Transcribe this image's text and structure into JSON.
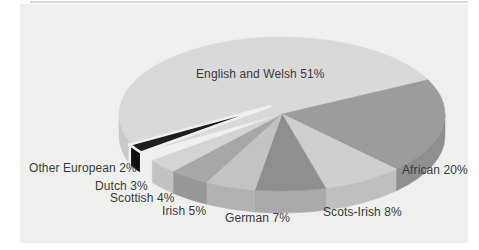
{
  "figure": {
    "background": "#ffffff",
    "panel_color": "#eff0ee",
    "top_edge_color": "#cfcfcf",
    "text_color": "#3a3a3a"
  },
  "chart_data": {
    "type": "pie",
    "style": "3d",
    "title": "",
    "unit": "percent",
    "grid": false,
    "legend_position": "labels-around-slices",
    "categories": [
      "English and Welsh",
      "African",
      "Scots-Irish",
      "German",
      "Irish",
      "Scottish",
      "Dutch",
      "Other European"
    ],
    "values": [
      51,
      20,
      8,
      7,
      5,
      4,
      3,
      2
    ],
    "slices": [
      {
        "name": "English and Welsh",
        "value": 51,
        "label": "English and Welsh 51%",
        "color": "#d9d9d9",
        "side_color": "#c9c9c9",
        "label_x": 196,
        "label_y": 68,
        "exploded": false
      },
      {
        "name": "African",
        "value": 20,
        "label": "African 20%",
        "color": "#9c9c9c",
        "side_color": "#8f8f8f",
        "label_x": 402,
        "label_y": 164,
        "exploded": false
      },
      {
        "name": "Scots-Irish",
        "value": 8,
        "label": "Scots-Irish 8%",
        "color": "#cecece",
        "side_color": "#bfbfbf",
        "label_x": 323,
        "label_y": 206,
        "exploded": false
      },
      {
        "name": "German",
        "value": 7,
        "label": "German 7%",
        "color": "#8f8f8f",
        "side_color": "#a9a9a9",
        "label_x": 225,
        "label_y": 212,
        "exploded": false
      },
      {
        "name": "Irish",
        "value": 5,
        "label": "Irish 5%",
        "color": "#c3c3c3",
        "side_color": "#b2b2b2",
        "label_x": 162,
        "label_y": 205,
        "exploded": false
      },
      {
        "name": "Scottish",
        "value": 4,
        "label": "Scottish 4%",
        "color": "#a7a7a7",
        "side_color": "#989898",
        "label_x": 110,
        "label_y": 192,
        "exploded": false
      },
      {
        "name": "Dutch",
        "value": 3,
        "label": "Dutch 3%",
        "color": "#d3d3d3",
        "side_color": "#c2c2c2",
        "label_x": 95,
        "label_y": 180,
        "exploded": false
      },
      {
        "name": "Other European",
        "value": 2,
        "label": "Other European 2%",
        "color": "#1e1e1e",
        "side_color": "#0d0d0d",
        "label_x": 29,
        "label_y": 162,
        "exploded": true
      }
    ],
    "layout": {
      "cx": 282,
      "cy": 114,
      "rx": 163,
      "ry": 77,
      "depth": 22,
      "start_angle": 210,
      "direction": "clockwise",
      "explode_dx": -11,
      "explode_dy": -8,
      "gap_stroke": "#eff0ee"
    }
  }
}
